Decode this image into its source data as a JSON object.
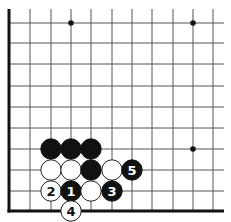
{
  "diagram": {
    "type": "go-board-fragment",
    "board": {
      "columns_x": [
        9,
        30,
        51,
        71,
        91,
        112,
        132,
        152,
        173,
        193,
        213
      ],
      "rows_y": [
        23,
        43,
        64,
        86,
        107,
        128,
        149,
        170,
        191,
        211
      ],
      "line_extend_top": 9,
      "line_extend_right": 224,
      "left_edge_col": 0,
      "bottom_edge_row": 9,
      "line_color": "#555555",
      "edge_color": "#111111"
    },
    "star_points": [
      {
        "col": 3,
        "row": 0
      },
      {
        "col": 9,
        "row": 0
      },
      {
        "col": 9,
        "row": 6
      }
    ],
    "stones": [
      {
        "col": 2,
        "row": 6,
        "color": "black",
        "label": ""
      },
      {
        "col": 3,
        "row": 6,
        "color": "black",
        "label": ""
      },
      {
        "col": 4,
        "row": 6,
        "color": "black",
        "label": ""
      },
      {
        "col": 2,
        "row": 7,
        "color": "white",
        "label": ""
      },
      {
        "col": 3,
        "row": 7,
        "color": "white",
        "label": ""
      },
      {
        "col": 4,
        "row": 7,
        "color": "black",
        "label": ""
      },
      {
        "col": 5,
        "row": 7,
        "color": "white",
        "label": ""
      },
      {
        "col": 6,
        "row": 7,
        "color": "black",
        "label": "5"
      },
      {
        "col": 2,
        "row": 8,
        "color": "white",
        "label": "2"
      },
      {
        "col": 3,
        "row": 8,
        "color": "black",
        "label": "1"
      },
      {
        "col": 4,
        "row": 8,
        "color": "white",
        "label": ""
      },
      {
        "col": 5,
        "row": 8,
        "color": "black",
        "label": "3"
      },
      {
        "col": 3,
        "row": 9,
        "color": "white",
        "label": "4"
      }
    ],
    "colors": {
      "black_stone": "#111111",
      "white_stone": "#ffffff",
      "white_stone_outline": "#222222",
      "star_point": "#111111"
    }
  }
}
